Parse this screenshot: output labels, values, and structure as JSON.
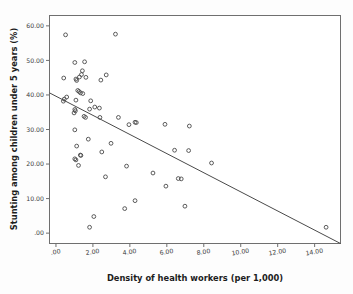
{
  "chart_data": {
    "type": "scatter",
    "title": "",
    "xlabel": "Density of health workers (per 1,000)",
    "ylabel": "Stunting among children under 5 years (%)",
    "xlim": [
      -0.35,
      15.4
    ],
    "ylim": [
      -3.0,
      63.0
    ],
    "grid": false,
    "legend": "none",
    "xticks": [
      0,
      2,
      4,
      6,
      8,
      10,
      12,
      14
    ],
    "xtick_labels": [
      ".00",
      "2.00",
      "4.00",
      "6.00",
      "8.00",
      "10.00",
      "12.00",
      "14.00"
    ],
    "yticks": [
      0,
      10,
      20,
      30,
      40,
      50,
      60
    ],
    "ytick_labels": [
      ".00",
      "10.00",
      "20.00",
      "30.00",
      "40.00",
      "50.00",
      "60.00"
    ],
    "marker": "open-circle",
    "marker_color": "#4a4a4a",
    "points": [
      [
        0.52,
        57.4
      ],
      [
        3.22,
        57.6
      ],
      [
        1.02,
        49.4
      ],
      [
        1.55,
        49.6
      ],
      [
        1.43,
        47.0
      ],
      [
        1.38,
        45.9
      ],
      [
        1.27,
        45.2
      ],
      [
        1.62,
        45.1
      ],
      [
        0.42,
        44.9
      ],
      [
        1.08,
        44.6
      ],
      [
        1.12,
        44.2
      ],
      [
        2.72,
        45.8
      ],
      [
        2.43,
        44.3
      ],
      [
        1.18,
        41.3
      ],
      [
        1.25,
        41.0
      ],
      [
        1.33,
        40.6
      ],
      [
        1.45,
        40.4
      ],
      [
        0.58,
        39.4
      ],
      [
        0.45,
        38.8
      ],
      [
        1.08,
        38.5
      ],
      [
        1.88,
        38.3
      ],
      [
        0.4,
        38.2
      ],
      [
        2.1,
        36.5
      ],
      [
        2.35,
        36.2
      ],
      [
        1.82,
        35.9
      ],
      [
        1.02,
        35.8
      ],
      [
        1.05,
        35.4
      ],
      [
        0.98,
        34.8
      ],
      [
        1.52,
        33.8
      ],
      [
        1.6,
        33.5
      ],
      [
        2.38,
        33.5
      ],
      [
        3.38,
        33.5
      ],
      [
        3.95,
        31.4
      ],
      [
        4.28,
        32.1
      ],
      [
        4.35,
        32.0
      ],
      [
        5.9,
        31.5
      ],
      [
        7.22,
        31.0
      ],
      [
        1.02,
        29.9
      ],
      [
        1.75,
        27.2
      ],
      [
        2.98,
        26.0
      ],
      [
        1.12,
        25.2
      ],
      [
        2.48,
        23.5
      ],
      [
        6.42,
        24.0
      ],
      [
        7.18,
        23.9
      ],
      [
        1.02,
        21.5
      ],
      [
        1.08,
        21.2
      ],
      [
        1.32,
        22.6
      ],
      [
        1.35,
        22.5
      ],
      [
        1.22,
        19.6
      ],
      [
        3.82,
        19.4
      ],
      [
        8.42,
        20.3
      ],
      [
        5.25,
        17.4
      ],
      [
        6.62,
        15.8
      ],
      [
        6.78,
        15.7
      ],
      [
        5.95,
        13.6
      ],
      [
        2.68,
        16.3
      ],
      [
        4.28,
        9.4
      ],
      [
        3.72,
        7.1
      ],
      [
        6.98,
        7.8
      ],
      [
        2.05,
        4.8
      ],
      [
        1.82,
        1.7
      ],
      [
        14.62,
        1.7
      ]
    ],
    "fit_line": {
      "type": "linear",
      "x_start": -0.35,
      "y_start": 40.6,
      "x_end": 15.4,
      "y_end": -3.0,
      "description": "negative linear fit line"
    }
  },
  "axis_titles": {
    "x": "Density of health workers (per 1,000)",
    "y": "Stunting among children under 5 years (%)"
  }
}
